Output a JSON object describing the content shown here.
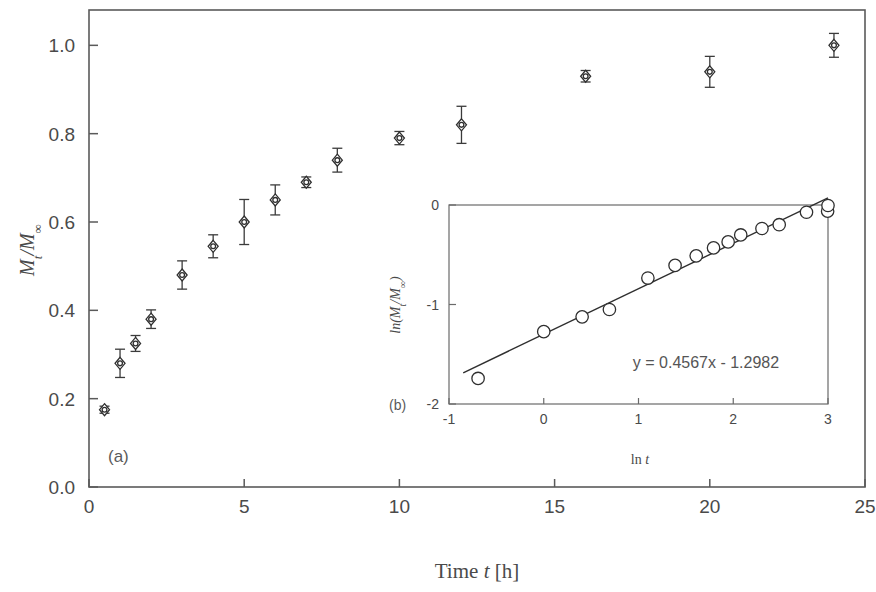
{
  "figure": {
    "panel_a_label": "(a)",
    "panel_b_label": "(b)"
  },
  "chart_data": [
    {
      "type": "scatter",
      "id": "main",
      "title": "",
      "xlabel": "Time t [h]",
      "ylabel": "Mt/M∞",
      "ylabel_parts": {
        "lead": "M",
        "sub": "t",
        "mid": "/M",
        "sup": "∞"
      },
      "xlabel_parts": {
        "lead": "Time ",
        "ital": "t",
        "tail": " [h]"
      },
      "xlim": [
        0,
        25
      ],
      "ylim": [
        0.0,
        1.08
      ],
      "xticks": [
        0,
        5,
        10,
        15,
        20,
        25
      ],
      "xtick_labels": [
        "0",
        "5",
        "10",
        "15",
        "20",
        "25"
      ],
      "yticks": [
        0.0,
        0.2,
        0.4,
        0.6,
        0.8,
        1.0
      ],
      "ytick_labels": [
        "0.0",
        "0.2",
        "0.4",
        "0.6",
        "0.8",
        "1.0"
      ],
      "grid": false,
      "legend": "none",
      "errorbars": true,
      "x": [
        0.5,
        1,
        1.5,
        2,
        3,
        4,
        5,
        6,
        7,
        8,
        10,
        12,
        16,
        20,
        24
      ],
      "values": [
        0.175,
        0.28,
        0.325,
        0.38,
        0.48,
        0.545,
        0.6,
        0.65,
        0.69,
        0.74,
        0.79,
        0.82,
        0.93,
        0.94,
        1.0
      ],
      "yerr": [
        0.008,
        0.032,
        0.018,
        0.021,
        0.032,
        0.026,
        0.051,
        0.034,
        0.012,
        0.027,
        0.015,
        0.042,
        0.013,
        0.035,
        0.027
      ]
    },
    {
      "type": "scatter",
      "id": "inset",
      "title": "",
      "xlabel": "ln t",
      "ylabel": "ln(Mt/M∞)",
      "ylabel_parts": {
        "lead": "ln(M",
        "sub": "t",
        "mid": "/M",
        "sup": "∞",
        "tail": ")"
      },
      "xlabel_parts": {
        "lead": "ln ",
        "ital": "t"
      },
      "xlim": [
        -1,
        3
      ],
      "ylim": [
        -2,
        0
      ],
      "xticks": [
        -1,
        0,
        1,
        2,
        3
      ],
      "xtick_labels": [
        "-1",
        "0",
        "1",
        "2",
        "3"
      ],
      "yticks": [
        -2,
        -1,
        0
      ],
      "ytick_labels": [
        "-2",
        "-1",
        "0"
      ],
      "grid": false,
      "legend": "none",
      "errorbars": false,
      "x": [
        -0.693,
        0.0,
        0.405,
        0.693,
        1.099,
        1.386,
        1.609,
        1.792,
        1.946,
        2.079,
        2.303,
        2.485,
        2.773,
        2.996,
        3.0
      ],
      "values": [
        -1.743,
        -1.273,
        -1.124,
        -1.05,
        -0.734,
        -0.607,
        -0.511,
        -0.431,
        -0.371,
        -0.301,
        -0.236,
        -0.198,
        -0.073,
        -0.062,
        -0.005
      ],
      "fit": {
        "slope": 0.4567,
        "intercept": -1.2982,
        "x_start": -0.85,
        "x_end": 3.0
      },
      "annotation": "y = 0.4567x - 1.2982"
    }
  ]
}
